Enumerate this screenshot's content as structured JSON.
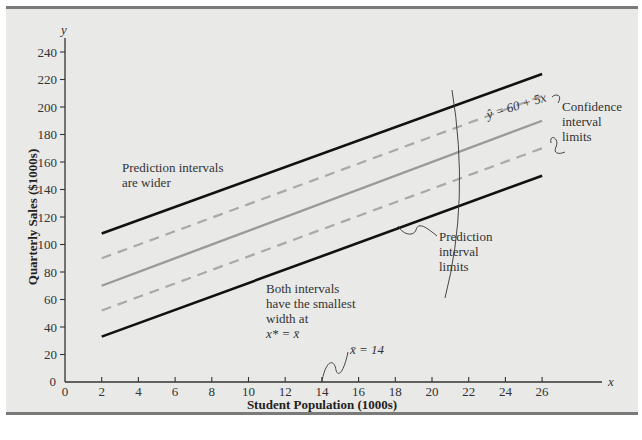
{
  "chart_data": {
    "type": "line",
    "title": "",
    "xlabel": "Student Population (1000s)",
    "ylabel": "Quarterly Sales ($1000s)",
    "x_axis_symbol": "x",
    "y_axis_symbol": "y",
    "xlim": [
      0,
      28
    ],
    "ylim": [
      0,
      250
    ],
    "x_ticks": [
      0,
      2,
      4,
      6,
      8,
      10,
      12,
      14,
      16,
      18,
      20,
      22,
      24,
      26
    ],
    "y_ticks": [
      0,
      20,
      40,
      60,
      80,
      100,
      120,
      140,
      160,
      180,
      200,
      220,
      240
    ],
    "grid": false,
    "x": [
      2,
      26
    ],
    "series": [
      {
        "name": "Upper prediction interval limit",
        "style": "solid-black",
        "values": [
          108,
          224
        ]
      },
      {
        "name": "Upper confidence interval limit",
        "style": "dashed-gray",
        "values": [
          90,
          208
        ]
      },
      {
        "name": "Estimated regression line ŷ = 60 + 5x",
        "style": "solid-gray",
        "values": [
          70,
          190
        ]
      },
      {
        "name": "Lower confidence interval limit",
        "style": "dashed-gray",
        "values": [
          52,
          170
        ]
      },
      {
        "name": "Lower prediction interval limit",
        "style": "solid-black",
        "values": [
          33,
          150
        ]
      }
    ],
    "annotations": [
      {
        "text": "ŷ = 60 + 5x",
        "target": "regression line"
      },
      {
        "text": "Confidence interval limits",
        "target": "dashed lines"
      },
      {
        "text": "Prediction interval limits",
        "target": "solid black lines"
      },
      {
        "text": "Prediction intervals are wider"
      },
      {
        "text": "Both intervals have the smallest width at x* = x̄"
      },
      {
        "text": "x̄ = 14",
        "x": 14
      }
    ]
  },
  "labels": {
    "y_symbol": "y",
    "x_symbol": "x",
    "y_title": "Quarterly Sales ($1000s)",
    "x_title": "Student Population (1000s)",
    "origin_y": "0",
    "x_ticks": [
      "0",
      "2",
      "4",
      "6",
      "8",
      "10",
      "12",
      "14",
      "16",
      "18",
      "20",
      "22",
      "24",
      "26"
    ],
    "y_ticks": [
      "20",
      "40",
      "60",
      "80",
      "100",
      "120",
      "140",
      "160",
      "180",
      "200",
      "220",
      "240"
    ],
    "equation": "ŷ = 60 + 5x",
    "confidence_label": [
      "Confidence",
      "interval",
      "limits"
    ],
    "prediction_label": [
      "Prediction",
      "interval",
      "limits"
    ],
    "wider_label": [
      "Prediction intervals",
      "are wider"
    ],
    "smallest_label": [
      "Both intervals",
      "have the smallest",
      "width at",
      "x* = x̄"
    ],
    "xbar_label": "x̄ = 14"
  },
  "colors": {
    "background": "#e9e9e7",
    "frame": "#7a7a7a",
    "prediction": "#111111",
    "confidence": "#a9a9a9",
    "regression": "#9a9a9a",
    "axis": "#333333"
  }
}
